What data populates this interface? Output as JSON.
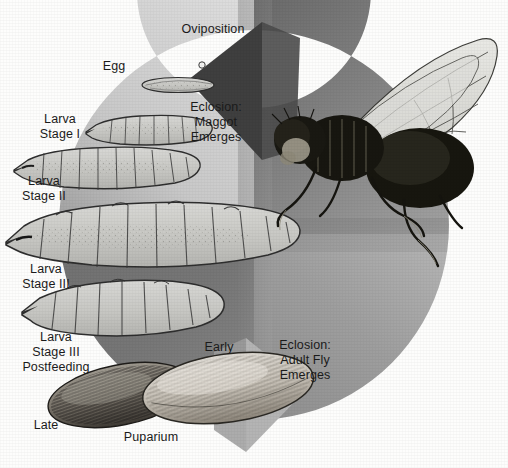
{
  "diagram": {
    "type": "cycle-diagram",
    "background_color": "#fdfdfc",
    "text_color": "#1b1b1b",
    "ring": {
      "description": "circular clockwise arrow band",
      "light_gray": "#cfcfcf",
      "mid_gray": "#9a9a9a",
      "dark_gray": "#5b5b5b",
      "darkest_gray": "#3f3f3f",
      "arrowheads": 2
    }
  },
  "labels": {
    "oviposition": "Oviposition",
    "egg": "Egg",
    "eclosion_maggot": "Eclosion:\nMaggot\nEmerges",
    "larva_stage_1": "Larva\nStage I",
    "larva_stage_2": "Larva\nStage II",
    "larva_stage_3": "Larva\nStage III",
    "larva_stage_3_postfeeding": "Larva\nStage III\nPostfeeding",
    "early": "Early",
    "late": "Late",
    "puparium": "Puparium",
    "eclosion_adult": "Eclosion:\nAdult Fly\nEmerges"
  },
  "stages": [
    {
      "name": "egg",
      "label": "Egg",
      "order": 1
    },
    {
      "name": "larva-stage-1",
      "label": "Larva Stage I",
      "order": 2
    },
    {
      "name": "larva-stage-2",
      "label": "Larva Stage II",
      "order": 3
    },
    {
      "name": "larva-stage-3",
      "label": "Larva Stage III",
      "order": 4
    },
    {
      "name": "larva-stage-3-postfeeding",
      "label": "Larva Stage III Postfeeding",
      "order": 5
    },
    {
      "name": "puparium-early",
      "label": "Early Puparium",
      "order": 6
    },
    {
      "name": "puparium-late",
      "label": "Late Puparium",
      "order": 7
    },
    {
      "name": "adult-fly",
      "label": "Adult Fly",
      "order": 8
    }
  ],
  "transitions": [
    {
      "name": "oviposition",
      "label": "Oviposition"
    },
    {
      "name": "eclosion-maggot",
      "label": "Eclosion: Maggot Emerges"
    },
    {
      "name": "eclosion-adult",
      "label": "Eclosion: Adult Fly Emerges"
    }
  ]
}
